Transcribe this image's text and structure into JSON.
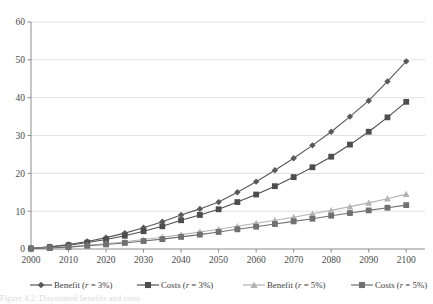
{
  "chart_data": {
    "type": "line",
    "title": "",
    "xlabel": "",
    "ylabel": "",
    "xlim": [
      2000,
      2105
    ],
    "ylim": [
      0,
      60
    ],
    "yticks": [
      0,
      10,
      20,
      30,
      40,
      50,
      60
    ],
    "xticks": [
      2000,
      2010,
      2020,
      2030,
      2040,
      2050,
      2060,
      2070,
      2080,
      2090,
      2100
    ],
    "grid": "horizontal",
    "legend_position": "bottom",
    "marker_interval_years": 5,
    "x": [
      2000,
      2005,
      2010,
      2015,
      2020,
      2025,
      2030,
      2035,
      2040,
      2045,
      2050,
      2055,
      2060,
      2065,
      2070,
      2075,
      2080,
      2085,
      2090,
      2095,
      2100
    ],
    "series": [
      {
        "name": "Benefit (r = 3%)",
        "marker": "diamond",
        "color": "#595959",
        "values": [
          0.2,
          0.6,
          1.2,
          2.0,
          3.0,
          4.2,
          5.6,
          7.2,
          9.0,
          10.6,
          12.4,
          15.0,
          17.8,
          20.8,
          24.0,
          27.4,
          31.0,
          35.0,
          39.2,
          44.3,
          49.6
        ]
      },
      {
        "name": "Costs (r = 3%)",
        "marker": "square",
        "color": "#4d4d4d",
        "values": [
          0.15,
          0.5,
          1.0,
          1.7,
          2.5,
          3.5,
          4.7,
          6.0,
          7.6,
          9.0,
          10.5,
          12.4,
          14.4,
          16.6,
          19.0,
          21.6,
          24.4,
          27.6,
          31.0,
          34.8,
          38.9
        ]
      },
      {
        "name": "Benefit (r = 5%)",
        "marker": "triangle",
        "color": "#b3b3b3",
        "values": [
          0.1,
          0.3,
          0.6,
          1.0,
          1.4,
          1.9,
          2.5,
          3.1,
          3.8,
          4.5,
          5.2,
          6.0,
          6.8,
          7.6,
          8.4,
          9.3,
          10.2,
          11.2,
          12.2,
          13.3,
          14.5
        ]
      },
      {
        "name": "Costs (r = 5%)",
        "marker": "square",
        "color": "#707070",
        "values": [
          0.1,
          0.25,
          0.5,
          0.85,
          1.2,
          1.6,
          2.1,
          2.6,
          3.2,
          3.8,
          4.5,
          5.2,
          5.9,
          6.6,
          7.3,
          8.0,
          8.8,
          9.5,
          10.2,
          10.9,
          11.6
        ]
      }
    ]
  },
  "axis": {
    "y_tick_labels": [
      "60",
      "50",
      "40",
      "30",
      "20",
      "10",
      "0"
    ],
    "x_tick_labels": [
      "2000",
      "2010",
      "2020",
      "2030",
      "2040",
      "2050",
      "2060",
      "2070",
      "2080",
      "2090",
      "2100"
    ]
  },
  "legend": {
    "items": [
      {
        "label_main": "Benefit (",
        "label_ital": "r",
        "label_tail": " = 3%)",
        "full": "Benefit (r = 3%)",
        "marker": "diamond",
        "color": "#595959"
      },
      {
        "label_main": "Costs (",
        "label_ital": "r",
        "label_tail": " = 3%)",
        "full": "Costs (r = 3%)",
        "marker": "square",
        "color": "#4d4d4d"
      },
      {
        "label_main": "Benefit (",
        "label_ital": "r",
        "label_tail": " = 5%)",
        "full": "Benefit (r = 5%)",
        "marker": "triangle",
        "color": "#b3b3b3"
      },
      {
        "label_main": "Costs (",
        "label_ital": "r",
        "label_tail": " = 5%)",
        "full": "Costs (r = 5%)",
        "marker": "square",
        "color": "#707070"
      }
    ]
  },
  "caption": {
    "text": "Figure 4.2. Discounted benefits and costs"
  },
  "colors": {
    "grid": "#d6d6d6",
    "axis": "#808080",
    "text": "#4a4a4a",
    "background": "#ffffff"
  }
}
